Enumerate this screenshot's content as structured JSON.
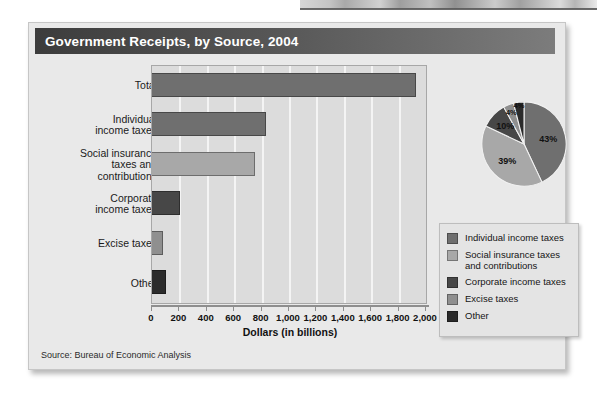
{
  "figure": {
    "title": "Government Receipts, by Source, 2004",
    "source": "Source:  Bureau of Economic Analysis"
  },
  "chart_data": [
    {
      "type": "bar",
      "orientation": "horizontal",
      "title": "Government Receipts, by Source, 2004",
      "xlabel": "Dollars (in billions)",
      "ylabel": "",
      "xlim": [
        0,
        2000
      ],
      "xticks": [
        0,
        200,
        400,
        600,
        800,
        1000,
        1200,
        1400,
        1600,
        1800,
        2000
      ],
      "xticklabels": [
        "0",
        "200",
        "400",
        "600",
        "800",
        "1,000",
        "1,200",
        "1,400",
        "1,600",
        "1,800",
        "2,000"
      ],
      "grid": true,
      "legend_position": "right",
      "categories": [
        "Total",
        "Individual\nincome taxes",
        "Social insurance\ntaxes and\ncontributions",
        "Corporate\nincome taxes",
        "Excise taxes",
        "Other"
      ],
      "values": [
        1930,
        835,
        755,
        205,
        80,
        105
      ],
      "colors": [
        "#6f6f6f",
        "#6f6f6f",
        "#a8a8a8",
        "#474747",
        "#8f8f8f",
        "#2b2b2b"
      ]
    },
    {
      "type": "pie",
      "labels": [
        "Individual income taxes",
        "Social insurance taxes and contributions",
        "Corporate income taxes",
        "Excise taxes",
        "Other"
      ],
      "values": [
        43,
        39,
        10,
        4,
        4
      ],
      "display_labels": [
        "43%",
        "39%",
        "10%",
        "4%",
        "4%"
      ],
      "colors": [
        "#6f6f6f",
        "#a8a8a8",
        "#474747",
        "#8f8f8f",
        "#2b2b2b"
      ],
      "start_angle_deg": 0,
      "direction": "clockwise"
    }
  ],
  "legend": {
    "items": [
      {
        "label": "Individual income taxes",
        "color": "#6f6f6f"
      },
      {
        "label": "Social insurance taxes\nand contributions",
        "color": "#a8a8a8"
      },
      {
        "label": "Corporate income taxes",
        "color": "#474747"
      },
      {
        "label": "Excise taxes",
        "color": "#8f8f8f"
      },
      {
        "label": "Other",
        "color": "#2b2b2b"
      }
    ]
  }
}
